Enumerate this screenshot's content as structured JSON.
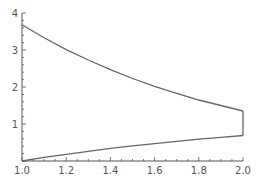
{
  "chart_data": {
    "type": "line",
    "title": "",
    "xlabel": "",
    "ylabel": "",
    "xlim": [
      1.0,
      2.0
    ],
    "ylim": [
      0,
      4
    ],
    "grid": false,
    "legend": null,
    "x_ticks": [
      "1.0",
      "1.2",
      "1.4",
      "1.6",
      "1.8",
      "2.0"
    ],
    "y_ticks": [
      "1",
      "2",
      "3",
      "4"
    ],
    "series": [
      {
        "name": "upper boundary (approx. 10·e^(-x))",
        "x": [
          1.0,
          1.1,
          1.2,
          1.3,
          1.4,
          1.5,
          1.6,
          1.7,
          1.8,
          1.9,
          2.0
        ],
        "values": [
          3.68,
          3.33,
          3.01,
          2.73,
          2.47,
          2.23,
          2.02,
          1.83,
          1.65,
          1.5,
          1.35
        ]
      },
      {
        "name": "lower boundary (approx. ln x)",
        "x": [
          1.0,
          1.1,
          1.2,
          1.3,
          1.4,
          1.5,
          1.6,
          1.7,
          1.8,
          1.9,
          2.0
        ],
        "values": [
          0.0,
          0.1,
          0.18,
          0.26,
          0.34,
          0.41,
          0.47,
          0.53,
          0.59,
          0.64,
          0.69
        ]
      },
      {
        "name": "right boundary segment at x = 2",
        "x": [
          2.0,
          2.0
        ],
        "values": [
          0.69,
          1.35
        ]
      }
    ],
    "colors": {
      "curve": "#666666",
      "axis": "#555555"
    }
  }
}
